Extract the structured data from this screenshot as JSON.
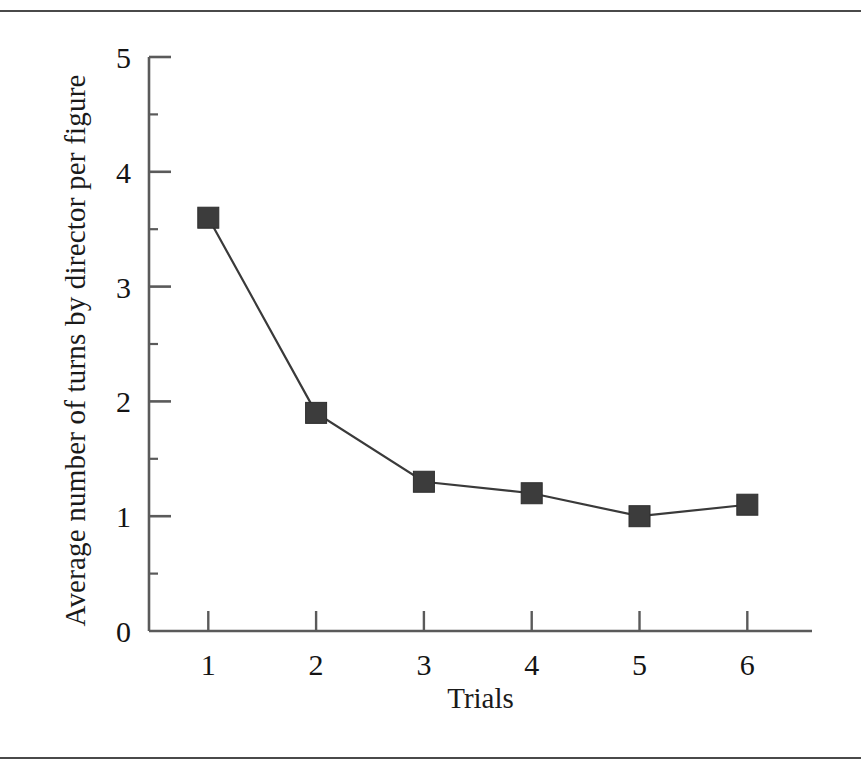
{
  "figure": {
    "rules": {
      "top": "horizontal-rule",
      "bottom": "horizontal-rule"
    }
  },
  "chart_data": {
    "type": "line",
    "title": "",
    "xlabel": "Trials",
    "ylabel": "Average number of turns by director per figure",
    "x": [
      1,
      2,
      3,
      4,
      5,
      6
    ],
    "values": [
      3.6,
      1.9,
      1.3,
      1.2,
      1.0,
      1.1
    ],
    "categories": [
      "1",
      "2",
      "3",
      "4",
      "5",
      "6"
    ],
    "xlim": [
      0.45,
      6.6
    ],
    "ylim": [
      0,
      5
    ],
    "xticks": [
      1,
      2,
      3,
      4,
      5,
      6
    ],
    "xtick_labels": [
      "1",
      "2",
      "3",
      "4",
      "5",
      "6"
    ],
    "yticks": [
      0,
      1,
      2,
      3,
      4,
      5
    ],
    "ytick_labels": [
      "0",
      "1",
      "2",
      "3",
      "4",
      "5"
    ],
    "y_minor_ticks": [
      0.5,
      1.5,
      2.5,
      3.5,
      4.5
    ],
    "grid": false,
    "legend": null,
    "marker": "square",
    "marker_color": "#3c3c3c",
    "line_color": "#3a3a3a",
    "axis_color": "#5a5a5a",
    "tick_direction": "in"
  }
}
